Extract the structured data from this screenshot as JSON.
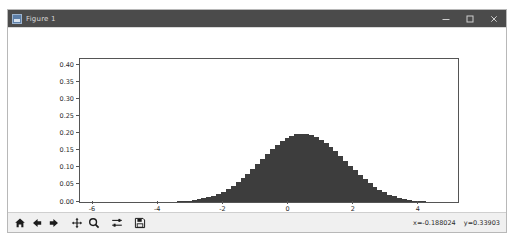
{
  "window": {
    "title": "Figure 1",
    "icon": "figure-icon",
    "controls": [
      {
        "name": "minimize",
        "glyph": "minimize-icon"
      },
      {
        "name": "maximize",
        "glyph": "maximize-icon"
      },
      {
        "name": "close",
        "glyph": "close-icon"
      }
    ]
  },
  "toolbar": {
    "buttons": [
      {
        "name": "home",
        "label": "Home",
        "icon": "home-icon"
      },
      {
        "name": "back",
        "label": "Back",
        "icon": "arrow-left-icon"
      },
      {
        "name": "forward",
        "label": "Forward",
        "icon": "arrow-right-icon"
      },
      {
        "name": "pan",
        "label": "Pan",
        "icon": "move-cross-icon"
      },
      {
        "name": "zoom",
        "label": "Zoom to rectangle",
        "icon": "magnifier-icon"
      },
      {
        "name": "subplots",
        "label": "Configure subplots",
        "icon": "sliders-icon"
      },
      {
        "name": "save",
        "label": "Save the figure",
        "icon": "floppy-disk-icon"
      }
    ],
    "coordinates": {
      "x_label": "x=-0.188024",
      "y_label": "y=0.33903"
    }
  },
  "chart_data": {
    "type": "bar",
    "title": "",
    "xlabel": "",
    "ylabel": "",
    "grid": false,
    "legend": null,
    "xlim": [
      -6.4,
      5.2
    ],
    "ylim": [
      0.0,
      0.42
    ],
    "xticks": [
      -6,
      -4,
      -2,
      0,
      2,
      4
    ],
    "yticks": [
      0.0,
      0.05,
      0.1,
      0.15,
      0.2,
      0.25,
      0.3,
      0.35,
      0.4
    ],
    "ytick_labels": [
      "0.00",
      "0.05",
      "0.10",
      "0.15",
      "0.20",
      "0.25",
      "0.30",
      "0.35",
      "0.40"
    ],
    "xtick_labels": [
      "-6",
      "-4",
      "-2",
      "0",
      "2",
      "4"
    ],
    "bar_color": "#3d3d3d",
    "x": [
      -4.4,
      -4.25,
      -4.1,
      -3.95,
      -3.8,
      -3.65,
      -3.5,
      -3.35,
      -3.2,
      -3.05,
      -2.9,
      -2.75,
      -2.6,
      -2.45,
      -2.3,
      -2.15,
      -2.0,
      -1.85,
      -1.7,
      -1.55,
      -1.4,
      -1.25,
      -1.1,
      -0.95,
      -0.8,
      -0.65,
      -0.5,
      -0.35,
      -0.2,
      -0.05,
      0.1,
      0.25,
      0.4,
      0.55,
      0.7,
      0.85,
      1.0,
      1.15,
      1.3,
      1.45,
      1.6,
      1.75,
      1.9,
      2.05,
      2.2,
      2.35,
      2.5,
      2.65,
      2.8,
      2.95,
      3.1,
      3.25,
      3.4,
      3.55,
      3.7,
      3.85,
      4.0,
      4.15,
      4.3,
      4.45
    ],
    "values": [
      0.0001,
      0.0001,
      0.0002,
      0.0003,
      0.0005,
      0.0008,
      0.0012,
      0.0018,
      0.0027,
      0.0039,
      0.0055,
      0.0076,
      0.0104,
      0.0139,
      0.0184,
      0.0239,
      0.0307,
      0.0387,
      0.048,
      0.0586,
      0.0704,
      0.0833,
      0.0971,
      0.1115,
      0.1261,
      0.1405,
      0.1543,
      0.167,
      0.1782,
      0.1874,
      0.1943,
      0.1987,
      0.2005,
      0.1997,
      0.1964,
      0.1906,
      0.1826,
      0.1727,
      0.1612,
      0.1484,
      0.1348,
      0.1208,
      0.1068,
      0.093,
      0.0797,
      0.0672,
      0.0557,
      0.0453,
      0.0361,
      0.0282,
      0.0216,
      0.0162,
      0.0119,
      0.0086,
      0.0061,
      0.0042,
      0.0029,
      0.0019,
      0.0012,
      0.0008
    ]
  }
}
